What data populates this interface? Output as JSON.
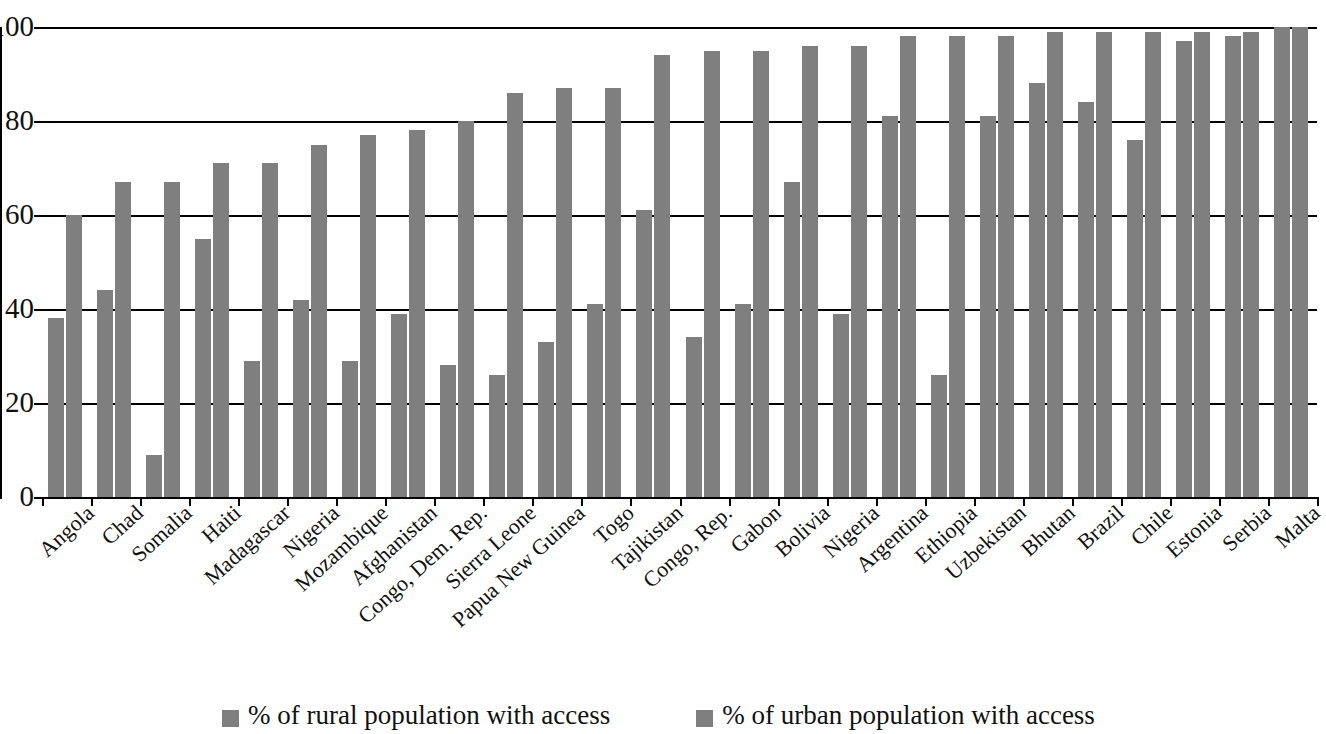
{
  "chart_data": {
    "type": "bar",
    "title": "",
    "subtitle": "",
    "xlabel": "",
    "ylabel": "",
    "ylim": [
      0,
      100
    ],
    "ytick_step": 20,
    "ytick_labels": [
      "100",
      "80",
      "60",
      "40",
      "20",
      "0"
    ],
    "ytick_values": [
      100,
      80,
      60,
      40,
      20,
      0
    ],
    "grid": "horizontal",
    "legend_position": "bottom",
    "bar_color": "#7f7f7f",
    "axis_color": "#000000",
    "categories": [
      "Angola",
      "Chad",
      "Somalia",
      "Haiti",
      "Madagascar",
      "Nigeria",
      "Mozambique",
      "Afghanistan",
      "Congo, Dem. Rep.",
      "Sierra Leone",
      "Papua New Guinea",
      "Togo",
      "Tajikistan",
      "Congo, Rep.",
      "Gabon",
      "Bolivia",
      "Nigeria",
      "Argentina",
      "Ethiopia",
      "Uzbekistan",
      "Bhutan",
      "Brazil",
      "Chile",
      "Estonia",
      "Serbia",
      "Malta"
    ],
    "series": [
      {
        "name": "% of rural population with access",
        "values": [
          38,
          44,
          9,
          55,
          29,
          42,
          29,
          39,
          28,
          26,
          33,
          41,
          61,
          34,
          41,
          67,
          39,
          81,
          26,
          81,
          88,
          84,
          76,
          97,
          98,
          100
        ]
      },
      {
        "name": "% of urban population with access",
        "values": [
          60,
          67,
          67,
          71,
          71,
          75,
          77,
          78,
          80,
          86,
          87,
          87,
          94,
          95,
          95,
          96,
          96,
          98,
          98,
          98,
          99,
          99,
          99,
          99,
          99,
          100
        ]
      }
    ]
  },
  "legend": {
    "items": [
      {
        "label": "% of rural population with access",
        "color": "#7f7f7f"
      },
      {
        "label": "% of urban population with access",
        "color": "#7f7f7f"
      }
    ]
  }
}
